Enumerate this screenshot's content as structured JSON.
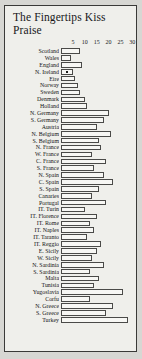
{
  "title": {
    "line1": "The Fingertips Kiss",
    "line2": "Praise"
  },
  "chart_data": {
    "type": "bar",
    "orientation": "horizontal",
    "title": "The Fingertips Kiss Praise",
    "xlabel": "",
    "ylabel": "",
    "xlim": [
      0,
      32
    ],
    "grid": false,
    "legend": null,
    "tick_labels": [
      "5",
      "10",
      "15",
      "20",
      "25",
      "30"
    ],
    "tick_values": [
      5,
      10,
      15,
      20,
      25,
      30
    ],
    "bar_facecolor": "#f7f7f4",
    "bar_edgecolor": "#4a4a48",
    "categories": [
      "Scotland",
      "Wales",
      "England",
      "N. Ireland",
      "Eire",
      "Norway",
      "Sweden",
      "Denmark",
      "Holland",
      "N. Germany",
      "S. Germany",
      "Austria",
      "N. Belgium",
      "S. Belgium",
      "N. France",
      "W. France",
      "C. France",
      "S. France",
      "N. Spain",
      "C. Spain",
      "S. Spain",
      "Canaries",
      "Portugal",
      "IT. Turin",
      "IT. Florence",
      "IT. Rome",
      "IT. Naples",
      "IT. Taranto",
      "IT. Reggio",
      "E. Sicily",
      "W. Sicily",
      "N. Sardinia",
      "S. Sardinia",
      "Malta",
      "Tunisia",
      "Yugoslavia",
      "Corfu",
      "N. Greece",
      "S. Greece",
      "Turkey"
    ],
    "values": [
      8,
      4,
      9,
      5,
      6,
      7,
      8,
      10,
      11,
      20,
      18,
      15,
      21,
      16,
      17,
      13,
      19,
      14,
      18,
      22,
      16,
      13,
      19,
      10,
      15,
      12,
      14,
      11,
      17,
      15,
      13,
      18,
      12,
      16,
      14,
      26,
      12,
      22,
      19,
      28
    ],
    "markers": [
      {
        "category": "N. Ireland",
        "value": 2
      }
    ]
  }
}
